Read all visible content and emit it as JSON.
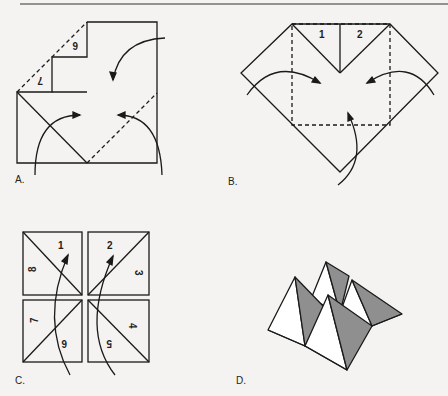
{
  "diagram": {
    "type": "paper-folding-instructions",
    "panels": [
      {
        "id": "A",
        "label": "A.",
        "numbers": [
          "6",
          "7"
        ],
        "description": "Square with two corners folded, arrows showing remaining corners folding to center"
      },
      {
        "id": "B",
        "label": "B.",
        "numbers": [
          "1",
          "2"
        ],
        "description": "Diamond with dashed fold square, arrows folding corners to center"
      },
      {
        "id": "C",
        "label": "C.",
        "numbers": [
          "1",
          "2",
          "3",
          "4",
          "5",
          "6",
          "7",
          "8"
        ],
        "description": "Four squares with diagonal creases and numbered triangles, arrows folding up"
      },
      {
        "id": "D",
        "label": "D.",
        "description": "Finished fortune teller with shaded pyramid flaps"
      }
    ],
    "colors": {
      "line": "#1a1a1a",
      "shade": "#8f8f8f",
      "background": "#f4f3f1"
    }
  }
}
